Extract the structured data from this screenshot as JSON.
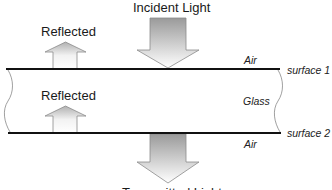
{
  "diagram": {
    "labels": {
      "incident": "Incident Light",
      "reflected_top": "Reflected",
      "reflected_inner": "Reflected",
      "transmitted": "Transmitted Light",
      "air_top": "Air",
      "glass": "Glass",
      "air_bottom": "Air",
      "surface1": "surface 1",
      "surface2": "surface 2"
    },
    "colors": {
      "line": "#111111",
      "arrow_stroke": "#8a8a8a",
      "arrow_fill_dark": "#9a9a9a",
      "arrow_fill_light": "#ffffff",
      "break_curve": "#888888"
    }
  }
}
